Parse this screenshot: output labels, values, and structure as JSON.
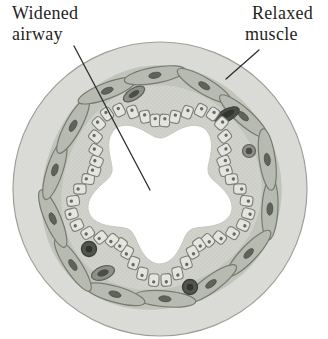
{
  "figure": {
    "labels": {
      "widened_airway": {
        "line1": "Widened",
        "line2": "airway"
      },
      "relaxed_muscle": {
        "line1": "Relaxed",
        "line2": "muscle"
      }
    }
  },
  "colors": {
    "background": "#ffffff",
    "outer_ring": "#dbdbd8",
    "outer_ring_outline": "#9d9d99",
    "stipple_light": "#c9c9c5",
    "submucosa": "#d2d2cd",
    "stipple_dark": "#b7b7b1",
    "muscle_band_base": "#c1c4bb",
    "muscle_cell_fill": "#b7bab1",
    "muscle_cell_outline": "#757a6e",
    "muscle_nucleus": "#5f6359",
    "epithelium_cell_fill": "#e4e4e0",
    "epithelium_cell_outline": "#7c8078",
    "epithelium_nucleus": "#6b6b65",
    "lumen": "#ffffff",
    "lumen_outline": "#c7c7c2",
    "gland_mid": "#8f9088",
    "gland_dark": "#4b4e47",
    "gland_core": "#32342e",
    "gland_outline": "#3c3f38",
    "leader_line": "#2e2e2c",
    "label_text": "#1f1f1d"
  }
}
